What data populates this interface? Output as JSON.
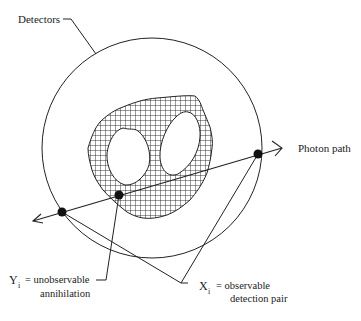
{
  "labels": {
    "detectors": "Detectors",
    "photon_path": "Photon path",
    "y_symbol": "Y",
    "y_sub": "i",
    "y_def_line1": "= unobservable",
    "y_def_line2": "annihilation",
    "x_symbol": "X",
    "x_sub": "i",
    "x_def_line1": "= observable",
    "x_def_line2": "detection pair"
  },
  "colors": {
    "ink": "#222222",
    "background": "#ffffff"
  }
}
